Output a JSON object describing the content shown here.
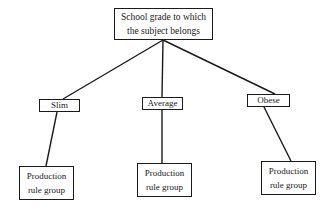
{
  "diagram": {
    "root": {
      "label": "School grade to which\nthe subject belongs"
    },
    "categories": [
      {
        "label": "Slim",
        "leaf": "Production\nrule group"
      },
      {
        "label": "Average",
        "leaf": "Production\nrule group"
      },
      {
        "label": "Obese",
        "leaf": "Production\nrule group"
      }
    ],
    "colors": {
      "line": "#1a1a1a",
      "background": "#ffffff"
    }
  }
}
